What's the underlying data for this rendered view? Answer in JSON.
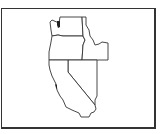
{
  "map": {
    "highlighted_state": "California",
    "states": [
      {
        "name": "Washington",
        "highlighted": false
      },
      {
        "name": "Oregon",
        "highlighted": false
      },
      {
        "name": "Idaho",
        "highlighted": false
      },
      {
        "name": "Nevada",
        "highlighted": false
      },
      {
        "name": "California",
        "highlighted": true
      }
    ],
    "colors": {
      "highlight_fill": "#c8c8c8",
      "default_fill": "#ffffff",
      "stroke": "#333333",
      "water": "#222222"
    }
  }
}
